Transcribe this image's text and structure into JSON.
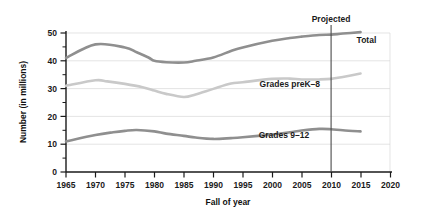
{
  "chart_data": {
    "type": "line",
    "title": "",
    "xlabel": "Fall of year",
    "ylabel": "Number (in millions)",
    "xlim": [
      1965,
      2020
    ],
    "ylim": [
      0,
      50
    ],
    "xticks": [
      "1965",
      "1970",
      "1975",
      "1980",
      "1985",
      "1990",
      "1995",
      "2000",
      "2005",
      "2010",
      "2015",
      "2020"
    ],
    "yticks": [
      "0",
      "10",
      "20",
      "30",
      "40",
      "50"
    ],
    "grid": "horizontal",
    "legend_position": "inline-labels",
    "annotations": [
      {
        "text": "Projected",
        "x": 2010,
        "kind": "vertical-rule-label"
      }
    ],
    "series": [
      {
        "name": "Total",
        "label": "Total",
        "color": "#8f8f8f",
        "label_x": 2016,
        "label_y": 46.5,
        "x": [
          1965,
          1970,
          1975,
          1977,
          1979,
          1980,
          1982,
          1985,
          1987,
          1990,
          1993,
          1995,
          2000,
          2003,
          2005,
          2008,
          2010,
          2012,
          2015
        ],
        "values": [
          41.0,
          45.9,
          44.8,
          43.1,
          41.2,
          40.0,
          39.5,
          39.4,
          40.0,
          41.2,
          43.5,
          44.8,
          47.2,
          48.2,
          48.7,
          49.3,
          49.4,
          49.8,
          50.3
        ]
      },
      {
        "name": "Grades preK-8",
        "label": "Grades preK–8",
        "color": "#c9c9c9",
        "label_x": 2003,
        "label_y": 30.5,
        "x": [
          1965,
          1970,
          1972,
          1975,
          1978,
          1980,
          1982,
          1985,
          1987,
          1990,
          1993,
          1995,
          2000,
          2003,
          2005,
          2008,
          2010,
          2012,
          2015
        ],
        "values": [
          31.0,
          33.0,
          32.6,
          31.7,
          30.5,
          29.3,
          28.1,
          27.0,
          27.9,
          29.9,
          31.8,
          32.3,
          33.5,
          33.6,
          33.3,
          33.3,
          33.5,
          34.2,
          35.4
        ]
      },
      {
        "name": "Grades 9-12",
        "label": "Grades 9–12",
        "color": "#8f8f8f",
        "label_x": 2002,
        "label_y": 12.2,
        "x": [
          1965,
          1970,
          1973,
          1975,
          1977,
          1980,
          1982,
          1985,
          1987,
          1990,
          1993,
          1995,
          2000,
          2003,
          2005,
          2008,
          2010,
          2012,
          2015
        ],
        "values": [
          11.0,
          13.3,
          14.3,
          14.8,
          15.1,
          14.6,
          13.8,
          13.0,
          12.4,
          11.9,
          12.2,
          12.5,
          13.5,
          14.3,
          14.9,
          15.5,
          15.4,
          15.0,
          14.6
        ]
      }
    ]
  },
  "axes": {
    "ylabel": "Number (in millions)",
    "xlabel": "Fall of year"
  }
}
